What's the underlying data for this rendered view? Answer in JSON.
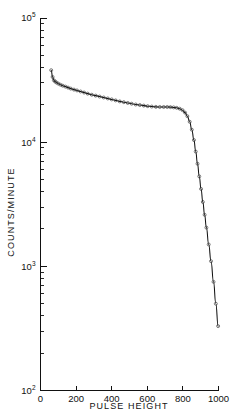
{
  "figure": {
    "background": "#ffffff",
    "ink_color": "#111111"
  },
  "chart_data": {
    "type": "line",
    "title": "",
    "subtitle": "",
    "xlabel": "PULSE  HEIGHT",
    "ylabel": "COUNTS/MINUTE",
    "xscale": "linear",
    "yscale": "log",
    "xlim": [
      0,
      1000
    ],
    "ylim": [
      100,
      100000
    ],
    "grid": false,
    "legend": null,
    "xticks": [
      0,
      200,
      400,
      600,
      800,
      1000
    ],
    "xtick_labels": [
      "0",
      "200",
      "400",
      "600",
      "800",
      "1000"
    ],
    "yticks": [
      100,
      1000,
      10000,
      100000
    ],
    "ytick_labels": [
      "10²",
      "10³",
      "10⁴",
      "10⁵"
    ],
    "ytick_mantissa": "10",
    "ytick_exponents": [
      "2",
      "3",
      "4",
      "5"
    ],
    "y_minor_ticks": true,
    "marker_style": "open-circle",
    "series": [
      {
        "name": "integral pulse height spectrum",
        "x": [
          60,
          68,
          75,
          82,
          90,
          100,
          112,
          125,
          140,
          155,
          170,
          188,
          205,
          225,
          245,
          265,
          288,
          310,
          332,
          355,
          378,
          400,
          422,
          445,
          468,
          490,
          512,
          535,
          558,
          580,
          602,
          625,
          648,
          670,
          692,
          712,
          730,
          748,
          765,
          782,
          798,
          812,
          825,
          838,
          850,
          862,
          872,
          882,
          892,
          902,
          912,
          922,
          932,
          945,
          958,
          972,
          985,
          998
        ],
        "y": [
          38000,
          33500,
          31500,
          30800,
          30200,
          29600,
          29000,
          28500,
          28000,
          27500,
          27000,
          26500,
          26100,
          25600,
          25100,
          24600,
          24100,
          23700,
          23300,
          22900,
          22500,
          22100,
          21700,
          21300,
          21000,
          20700,
          20400,
          20100,
          19900,
          19700,
          19500,
          19350,
          19250,
          19200,
          19200,
          19200,
          19150,
          19050,
          18900,
          18600,
          18100,
          17300,
          16200,
          14600,
          12600,
          10400,
          8400,
          6700,
          5300,
          4200,
          3300,
          2600,
          2050,
          1500,
          1100,
          750,
          500,
          330
        ]
      }
    ],
    "features": {
      "plateau_level": 19200,
      "plateau_range": [
        600,
        760
      ],
      "knee_pulse_height": 850,
      "endpoint": {
        "x": 998,
        "y": 330
      },
      "start_peak": {
        "x": 60,
        "y": 38000
      }
    }
  },
  "axes": {
    "x_axis_title": "PULSE  HEIGHT",
    "y_axis_title": "COUNTS/MINUTE"
  }
}
